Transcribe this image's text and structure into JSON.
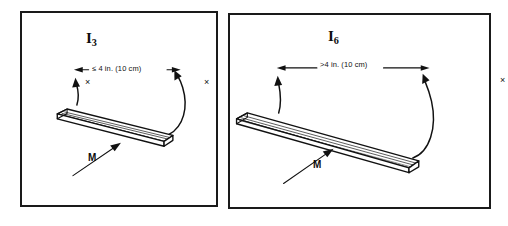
{
  "figure": {
    "background_color": "#ffffff",
    "ink_color": "#111111",
    "border_color": "#1a1a1a"
  },
  "panels": [
    {
      "id": "panel-left",
      "spec_label": "I",
      "spec_subscript": "3",
      "dimension_text": "≤ 4 in. (10 cm)",
      "x_mark_left": "×",
      "x_mark_right": "×",
      "moment_label": "M",
      "object": "plank"
    },
    {
      "id": "panel-right",
      "spec_label": "I",
      "spec_subscript": "6",
      "dimension_text": ">4 in. (10 cm)",
      "x_mark_left": "×",
      "x_mark_right": "×",
      "moment_label": "M",
      "object": "plank"
    }
  ]
}
